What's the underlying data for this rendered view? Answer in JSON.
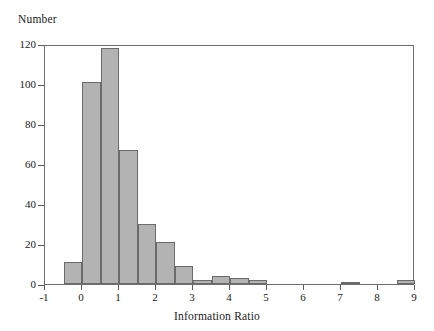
{
  "chart_data": {
    "type": "bar",
    "title": "",
    "xlabel": "Information Ratio",
    "ylabel": "Number",
    "xlim": [
      -1,
      9
    ],
    "ylim": [
      0,
      120
    ],
    "grid": false,
    "legend": null,
    "bin_width": 0.5,
    "xticks": [
      -1,
      0,
      1,
      2,
      3,
      4,
      5,
      6,
      7,
      8,
      9
    ],
    "xtick_labels": [
      "-1",
      "0",
      "1",
      "2",
      "3",
      "4",
      "5",
      "6",
      "7",
      "8",
      "9"
    ],
    "yticks": [
      0,
      20,
      40,
      60,
      80,
      100,
      120
    ],
    "ytick_labels": [
      "0",
      "20",
      "40",
      "60",
      "80",
      "100",
      "120"
    ],
    "bars": [
      {
        "bin_start": -0.5,
        "bin_end": 0.0,
        "value": 11
      },
      {
        "bin_start": 0.0,
        "bin_end": 0.5,
        "value": 101
      },
      {
        "bin_start": 0.5,
        "bin_end": 1.0,
        "value": 118
      },
      {
        "bin_start": 1.0,
        "bin_end": 1.5,
        "value": 67
      },
      {
        "bin_start": 1.5,
        "bin_end": 2.0,
        "value": 30
      },
      {
        "bin_start": 2.0,
        "bin_end": 2.5,
        "value": 21
      },
      {
        "bin_start": 2.5,
        "bin_end": 3.0,
        "value": 9
      },
      {
        "bin_start": 3.0,
        "bin_end": 3.5,
        "value": 2
      },
      {
        "bin_start": 3.5,
        "bin_end": 4.0,
        "value": 4
      },
      {
        "bin_start": 4.0,
        "bin_end": 4.5,
        "value": 3
      },
      {
        "bin_start": 4.5,
        "bin_end": 5.0,
        "value": 2
      },
      {
        "bin_start": 7.0,
        "bin_end": 7.5,
        "value": 1
      },
      {
        "bin_start": 8.5,
        "bin_end": 9.0,
        "value": 2
      }
    ]
  }
}
